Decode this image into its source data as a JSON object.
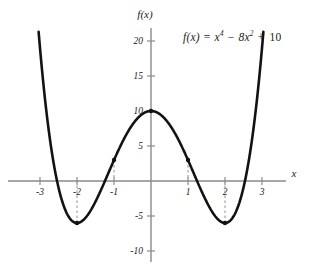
{
  "figure": {
    "equation_label": "f(x) = x⁴ − 8x² + 10",
    "equation_parts": {
      "lhs": "f(x)",
      "equals": "=",
      "term1_base": "x",
      "term1_exp": "4",
      "minus": "−",
      "term2_coef": "8x",
      "term2_exp": "2",
      "plus": "+",
      "constant": "10"
    },
    "yaxis_name": "f(x)",
    "xaxis_name": "x"
  },
  "chart_data": {
    "type": "line",
    "title": "",
    "subtitle": "",
    "xlabel": "x",
    "ylabel": "f(x)",
    "annotations": [
      "f(x) = x⁴ − 8x² + 10"
    ],
    "grid": false,
    "legend": null,
    "xlim": [
      -3.15,
      3.15
    ],
    "ylim": [
      -11.5,
      21.5
    ],
    "x_ticks": [
      -3,
      -2,
      -1,
      1,
      2,
      3
    ],
    "x_tick_labels": [
      "-3",
      "-2",
      "-1",
      "1",
      "2",
      "3"
    ],
    "y_ticks": [
      20,
      15,
      10,
      5,
      -5,
      -10
    ],
    "y_tick_labels": [
      "20",
      "15",
      "10",
      "5",
      "-5",
      "-10"
    ],
    "series": [
      {
        "name": "f(x) = x^4 - 8x^2 + 10",
        "expression": "x^4 - 8*x^2 + 10",
        "x": [
          -3.0,
          -2.8,
          -2.6,
          -2.4,
          -2.2,
          -2.0,
          -1.8,
          -1.6,
          -1.4,
          -1.2,
          -1.0,
          -0.8,
          -0.6,
          -0.4,
          -0.2,
          0.0,
          0.2,
          0.4,
          0.6,
          0.8,
          1.0,
          1.2,
          1.4,
          1.6,
          1.8,
          2.0,
          2.2,
          2.4,
          2.6,
          2.8,
          3.0
        ],
        "values": [
          19.0,
          8.66,
          0.59,
          -4.87,
          -7.69,
          -8.0,
          -6.43,
          -14.32,
          -11.84,
          -7.65,
          3.0,
          5.81,
          7.54,
          8.75,
          9.69,
          10.0,
          9.69,
          8.75,
          7.54,
          5.81,
          3.0,
          -0.45,
          -3.8,
          -4.9,
          -5.43,
          -6.0,
          -5.28,
          -1.92,
          4.61,
          14.66,
          19.0
        ]
      }
    ],
    "marked_points": [
      {
        "x": -2,
        "y": -6,
        "label": "",
        "leader_to_axis": true
      },
      {
        "x": -1,
        "y": 3,
        "label": "",
        "leader_to_axis": true
      },
      {
        "x": 0,
        "y": 10,
        "label": "",
        "leader_to_axis": false
      },
      {
        "x": 1,
        "y": 3,
        "label": "",
        "leader_to_axis": true
      },
      {
        "x": 2,
        "y": -6,
        "label": "",
        "leader_to_axis": true
      }
    ],
    "colors": {
      "curve": "#121212",
      "axis": "#8a8a8a",
      "leader": "#9a9a9a",
      "marker": "#121212",
      "background": "#ffffff"
    }
  }
}
